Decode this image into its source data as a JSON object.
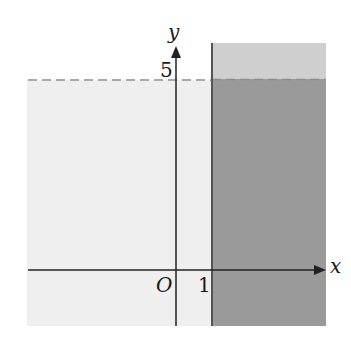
{
  "figure": {
    "type": "inequality-region-graph",
    "axes": {
      "x_label": "x",
      "y_label": "y",
      "origin_label": "O"
    },
    "tick_labels": {
      "x_tick": "1",
      "y_tick": "5"
    },
    "regions": [
      {
        "name": "left-region",
        "description": "x < 1, y < 5",
        "color": "#efefef"
      },
      {
        "name": "right-dark-region",
        "description": "x >= 1, y < 5",
        "color": "#9a9a9a"
      },
      {
        "name": "right-top-region",
        "description": "x >= 1, y > 5",
        "color": "#cfcfcf"
      }
    ],
    "boundaries": [
      {
        "name": "line-x-equals-1",
        "equation": "x = 1",
        "style": "solid",
        "color": "#555555"
      },
      {
        "name": "line-y-equals-5",
        "equation": "y = 5",
        "style": "dashed",
        "color": "#a8a8a8"
      }
    ]
  }
}
